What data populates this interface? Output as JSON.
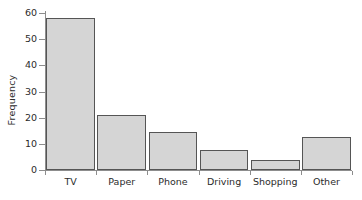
{
  "chart_data": {
    "type": "bar",
    "title": "",
    "xlabel": "",
    "ylabel": "Frequency",
    "categories": [
      "TV",
      "Paper",
      "Phone",
      "Driving",
      "Shopping",
      "Other"
    ],
    "values": [
      58,
      21,
      14.5,
      7.5,
      4,
      12.5
    ],
    "ylim": [
      0,
      60
    ],
    "yticks": [
      0,
      10,
      20,
      30,
      40,
      50,
      60
    ],
    "ytick_labels": [
      "0",
      "10",
      "20",
      "30",
      "40",
      "50",
      "60"
    ],
    "grid": false,
    "legend": null,
    "bar_fill_color": "#d5d5d5",
    "bar_border_color": "#555555",
    "axis_color": "#8d8d8d",
    "text_color": "#2b2b2b"
  }
}
